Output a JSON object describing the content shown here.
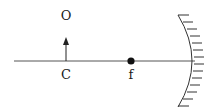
{
  "diagram": {
    "type": "concave-mirror-ray-setup",
    "labels": {
      "object": "O",
      "center": "C",
      "focus": "f"
    },
    "colors": {
      "stroke": "#333333",
      "text": "#1a1a1a",
      "background": "#ffffff"
    }
  }
}
